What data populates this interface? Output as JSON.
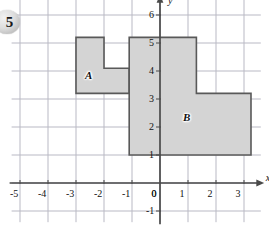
{
  "figure": {
    "exercise_number": "5",
    "background_color": "#ffffff",
    "grid_color": "#b9b9c4",
    "axis_color": "#4a4a4a",
    "shape_fill": "#d4d4d4",
    "shape_stroke": "#595959"
  },
  "axes": {
    "x_axis_label": "x",
    "y_axis_label": "y",
    "x_ticks": [
      "-5",
      "-4",
      "-3",
      "-2",
      "-1",
      "0",
      "1",
      "2",
      "3"
    ],
    "x_tick_values": [
      -5,
      -4,
      -3,
      -2,
      -1,
      0,
      1,
      2,
      3
    ],
    "y_ticks": [
      "6",
      "5",
      "4",
      "3",
      "2",
      "1",
      "0",
      "-1"
    ],
    "y_tick_values": [
      6,
      5,
      4,
      3,
      2,
      1,
      0,
      -1
    ],
    "x_range": [
      -5.3,
      3.6
    ],
    "y_range": [
      -1.4,
      6.6
    ],
    "grid_spacing": 1
  },
  "shapes": [
    {
      "label": "A",
      "label_x": -2.55,
      "label_y": 3.85,
      "description": "hexagonal-region-A",
      "vertices": [
        [
          -3.0,
          5.2
        ],
        [
          -2.0,
          5.2
        ],
        [
          -2.0,
          4.1
        ],
        [
          -1.1,
          4.1
        ],
        [
          -1.1,
          3.2
        ],
        [
          -3.0,
          3.2
        ]
      ]
    },
    {
      "label": "B",
      "label_x": 0.95,
      "label_y": 2.35,
      "description": "L-shaped-region-B",
      "vertices": [
        [
          -1.1,
          5.2
        ],
        [
          1.3,
          5.2
        ],
        [
          1.3,
          3.2
        ],
        [
          3.25,
          3.2
        ],
        [
          3.25,
          1.0
        ],
        [
          -1.1,
          1.0
        ]
      ]
    }
  ],
  "chart_data": {
    "type": "scatter",
    "title": "",
    "xlabel": "x",
    "ylabel": "y",
    "xlim": [
      -5.3,
      3.6
    ],
    "ylim": [
      -1.4,
      6.6
    ],
    "grid": true,
    "legend": "none",
    "annotations": [
      "A",
      "B"
    ],
    "polygons": [
      {
        "name": "A",
        "points": [
          [
            -3,
            5.2
          ],
          [
            -2,
            5.2
          ],
          [
            -2,
            4.1
          ],
          [
            -1.1,
            4.1
          ],
          [
            -1.1,
            3.2
          ],
          [
            -3,
            3.2
          ]
        ]
      },
      {
        "name": "B",
        "points": [
          [
            -1.1,
            5.2
          ],
          [
            1.3,
            5.2
          ],
          [
            1.3,
            3.2
          ],
          [
            3.25,
            3.2
          ],
          [
            3.25,
            1
          ],
          [
            -1.1,
            1
          ]
        ]
      }
    ]
  }
}
